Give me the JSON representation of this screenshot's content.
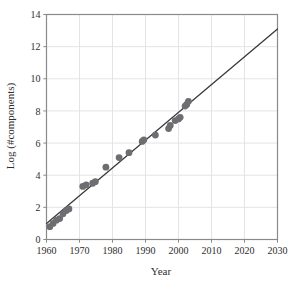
{
  "figure": {
    "background_color": "#ffffff",
    "frame_color": "#8a8a8a",
    "grid_color": "#e4e4e8",
    "title_remnant": ""
  },
  "chart_data": {
    "type": "scatter",
    "title": "",
    "xlabel": "Year",
    "ylabel": "Log (#components)",
    "xlim": [
      1960,
      2030
    ],
    "ylim": [
      0,
      14
    ],
    "xticks": [
      1960,
      1970,
      1980,
      1990,
      2000,
      2010,
      2020,
      2030
    ],
    "xtick_labels": [
      "1960",
      "1970",
      "1980",
      "1990",
      "2000",
      "2010",
      "2020",
      "2030"
    ],
    "yticks": [
      0,
      2,
      4,
      6,
      8,
      10,
      12,
      14
    ],
    "ytick_labels": [
      "0",
      "2",
      "4",
      "6",
      "8",
      "10",
      "12",
      "14"
    ],
    "grid": true,
    "legend": "none",
    "marker_color": "#6e6e72",
    "marker_size": 4.6,
    "line_color": "#3a3a3a",
    "line_width": 1.3,
    "points": [
      {
        "x": 1961,
        "y": 0.8
      },
      {
        "x": 1962,
        "y": 1.0
      },
      {
        "x": 1963,
        "y": 1.2
      },
      {
        "x": 1964,
        "y": 1.3
      },
      {
        "x": 1965,
        "y": 1.6
      },
      {
        "x": 1966,
        "y": 1.8
      },
      {
        "x": 1966.8,
        "y": 1.9
      },
      {
        "x": 1971,
        "y": 3.3
      },
      {
        "x": 1972,
        "y": 3.4
      },
      {
        "x": 1974,
        "y": 3.5
      },
      {
        "x": 1974.8,
        "y": 3.6
      },
      {
        "x": 1978,
        "y": 4.5
      },
      {
        "x": 1982,
        "y": 5.1
      },
      {
        "x": 1985,
        "y": 5.4
      },
      {
        "x": 1989,
        "y": 6.1
      },
      {
        "x": 1989.5,
        "y": 6.2
      },
      {
        "x": 1993,
        "y": 6.5
      },
      {
        "x": 1997,
        "y": 6.9
      },
      {
        "x": 1997.5,
        "y": 7.1
      },
      {
        "x": 1999,
        "y": 7.4
      },
      {
        "x": 2000,
        "y": 7.5
      },
      {
        "x": 2000.5,
        "y": 7.6
      },
      {
        "x": 2002,
        "y": 8.3
      },
      {
        "x": 2002.5,
        "y": 8.4
      },
      {
        "x": 2003,
        "y": 8.6
      }
    ],
    "trend_line": {
      "x": [
        1960,
        2030
      ],
      "y": [
        1.0,
        13.1
      ]
    }
  }
}
